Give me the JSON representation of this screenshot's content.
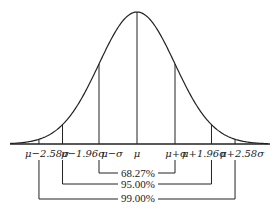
{
  "diagram": {
    "tick_labels": [
      "μ−2.58σ",
      "μ−1.96σ",
      "μ−σ",
      "μ",
      "μ+σ",
      "μ+1.96σ",
      "μ+2.58σ"
    ],
    "intervals": [
      {
        "label": "68.27%",
        "range": "μ±σ"
      },
      {
        "label": "95.00%",
        "range": "μ±1.96σ"
      },
      {
        "label": "99.00%",
        "range": "μ±2.58σ"
      }
    ]
  },
  "chart_data": {
    "type": "line",
    "x_tick_labels": [
      "μ−2.58σ",
      "μ−1.96σ",
      "μ−σ",
      "μ",
      "μ+σ",
      "μ+1.96σ",
      "μ+2.58σ"
    ],
    "annotations": [
      "68.27%",
      "95.00%",
      "99.00%"
    ]
  }
}
